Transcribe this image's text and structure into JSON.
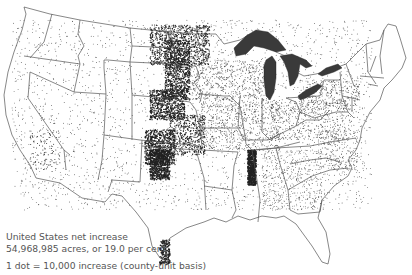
{
  "map": {
    "subject": "United States net increase (dot density map)",
    "colors": {
      "background": "#ffffff",
      "boundary": "#555555",
      "dot": "#222222",
      "lakes": "#3a3a3a"
    },
    "features": [
      "state-boundaries",
      "great-lakes",
      "dot-clusters"
    ]
  },
  "legend": {
    "line1": "United States net increase",
    "line2": "54,968,985 acres, or 19.0 per cent",
    "line3": "1 dot = 10,000 increase (county-unit basis)"
  }
}
